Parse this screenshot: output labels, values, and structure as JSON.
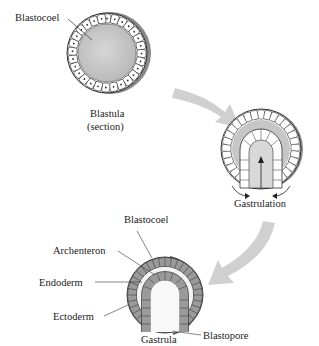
{
  "stages": [
    {
      "name": "blastula",
      "caption_line1": "Blastula",
      "caption_line2": "(section)",
      "labels": [
        "Blastocoel"
      ]
    },
    {
      "name": "gastrulation",
      "caption": "Gastrulation"
    },
    {
      "name": "gastrula",
      "caption": "Gastrula",
      "labels": [
        "Blastocoel",
        "Archenteron",
        "Endoderm",
        "Ectoderm",
        "Blastopore"
      ]
    }
  ],
  "labels": {
    "blastula_blastocoel": "Blastocoel",
    "blastula_caption1": "Blastula",
    "blastula_caption2": "(section)",
    "gastrulation_caption": "Gastrulation",
    "gastrula_blastocoel": "Blastocoel",
    "archenteron": "Archenteron",
    "endoderm": "Endoderm",
    "ectoderm": "Ectoderm",
    "blastopore": "Blastopore",
    "gastrula_caption": "Gastrula"
  },
  "colors": {
    "cavity": "#c8c8c8",
    "cell_fill": "#ffffff",
    "outline": "#333333",
    "arrow": "#cfcfcf",
    "ectoderm_cells": "#9a9a9a"
  }
}
